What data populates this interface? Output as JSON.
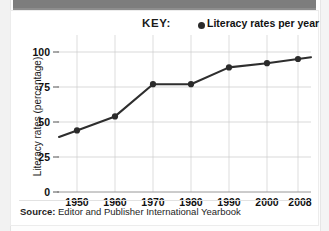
{
  "figure": {
    "legend_title": "KEY:",
    "legend_marker_icon": "filled-circle-marker",
    "legend_entry": "Literacy rates per year",
    "source_prefix": "Source:",
    "source_text": " Editor and Publisher International Yearbook",
    "accent_color": "#2b2b2b",
    "grid_color": "#c9c9c9",
    "band_color": "#7d7d7d"
  },
  "chart_data": {
    "type": "line",
    "title": "",
    "xlabel": "",
    "ylabel": "Literacy rates (percentage)",
    "categories": [
      "1950",
      "1960",
      "1970",
      "1980",
      "1990",
      "2000",
      "2008"
    ],
    "x": [
      1950,
      1960,
      1970,
      1980,
      1990,
      2000,
      2008
    ],
    "values": [
      44,
      54,
      77,
      77,
      89,
      92,
      95
    ],
    "series": [
      {
        "name": "Literacy rates per year",
        "values": [
          44,
          54,
          77,
          77,
          89,
          92,
          95
        ]
      }
    ],
    "ylim": [
      0,
      100
    ],
    "yticks": [
      0,
      25,
      50,
      75,
      100
    ],
    "ytick_labels": [
      "0",
      "25",
      "50",
      "75",
      "100"
    ],
    "xtick_labels": [
      "1950",
      "1960",
      "1970",
      "1980",
      "1990",
      "2000",
      "2008"
    ],
    "grid": true,
    "legend_position": "top-right",
    "marker": "circle",
    "line_extends_before_first_point": true,
    "line_extends_after_last_point": true
  }
}
